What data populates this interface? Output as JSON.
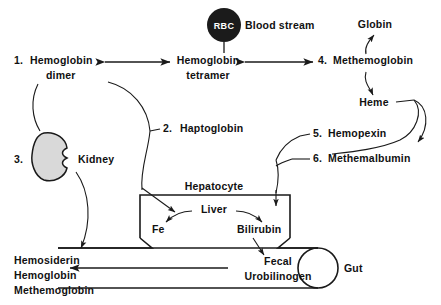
{
  "diagram": {
    "background_color": "#ffffff",
    "line_color": "#1a1a1a",
    "organ_fill_color": "#d9d9d9",
    "rbc_fill_color": "#1b1b1b"
  },
  "nodes": {
    "rbc": "RBC",
    "blood_stream": "Blood stream",
    "hemoglobin_dimer_num": "1.",
    "hemoglobin_dimer_line1": "Hemoglobin",
    "hemoglobin_dimer_line2": "dimer",
    "hemoglobin_tetramer_line1": "Hemoglobin",
    "hemoglobin_tetramer_line2": "tetramer",
    "methemoglobin_num": "4.",
    "methemoglobin": "Methemoglobin",
    "globin": "Globin",
    "heme": "Heme",
    "haptoglobin_num": "2.",
    "haptoglobin": "Haptoglobin",
    "hemopexin_num": "5.",
    "hemopexin": "Hemopexin",
    "methemalbumin_num": "6.",
    "methemalbumin": "Methemalbumin",
    "kidney_num": "3.",
    "kidney": "Kidney",
    "hepatocyte": "Hepatocyte",
    "liver": "Liver",
    "fe": "Fe",
    "bilirubin": "Bilirubin",
    "fecal_line1": "Fecal",
    "fecal_line2": "Urobilinogen",
    "gut": "Gut",
    "excretion_line1": "Hemosiderin",
    "excretion_line2": "Hemoglobin",
    "excretion_line3": "Methemoglobin"
  }
}
